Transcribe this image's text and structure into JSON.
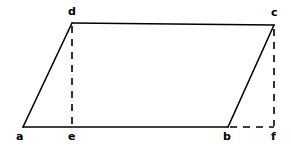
{
  "figure": {
    "canvas": {
      "width": 291,
      "height": 148
    },
    "stroke_color": "#000000",
    "background_color": "#ffffff",
    "solid_stroke_width": 1.6,
    "dashed_stroke_width": 1.6,
    "dash_pattern": "7,6"
  },
  "points": {
    "a": {
      "label": "a",
      "x": 23,
      "y": 127,
      "label_x": 16,
      "label_y": 131
    },
    "b": {
      "label": "b",
      "x": 228,
      "y": 127,
      "label_x": 223,
      "label_y": 131
    },
    "c": {
      "label": "c",
      "x": 274,
      "y": 25,
      "label_x": 271,
      "label_y": 7
    },
    "d": {
      "label": "d",
      "x": 72,
      "y": 23,
      "label_x": 68,
      "label_y": 6
    },
    "e": {
      "label": "e",
      "x": 72,
      "y": 127,
      "label_x": 68,
      "label_y": 131
    },
    "f": {
      "label": "f",
      "x": 274,
      "y": 127,
      "label_x": 271,
      "label_y": 131
    }
  },
  "edges": {
    "solid": [
      {
        "name": "side-ad",
        "from": "a",
        "to": "d",
        "x1": 23,
        "y1": 127,
        "x2": 72,
        "y2": 23
      },
      {
        "name": "side-dc",
        "from": "d",
        "to": "c",
        "x1": 72,
        "y1": 23,
        "x2": 274,
        "y2": 25
      },
      {
        "name": "side-bc",
        "from": "b",
        "to": "c",
        "x1": 228,
        "y1": 127,
        "x2": 274,
        "y2": 25
      },
      {
        "name": "side-ab",
        "from": "a",
        "to": "b",
        "x1": 23,
        "y1": 127,
        "x2": 228,
        "y2": 127
      }
    ],
    "dashed": [
      {
        "name": "altitude-de",
        "from": "d",
        "to": "e",
        "x1": 72,
        "y1": 26,
        "x2": 72,
        "y2": 126
      },
      {
        "name": "altitude-cf",
        "from": "c",
        "to": "f",
        "x1": 274,
        "y1": 29,
        "x2": 274,
        "y2": 126
      },
      {
        "name": "extension-bf",
        "from": "b",
        "to": "f",
        "x1": 230,
        "y1": 127,
        "x2": 274,
        "y2": 127
      }
    ]
  }
}
